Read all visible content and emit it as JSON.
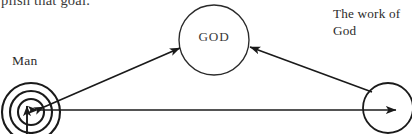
{
  "page": {
    "width": 412,
    "height": 134,
    "background_color": "#ffffff",
    "ink_color": "#1a1a1a"
  },
  "cut_text": {
    "text": "plish that goal.",
    "note": "partially cropped line of body text at very top of image"
  },
  "labels": {
    "man": "Man",
    "god": "GOD",
    "work_of_god": "The work of\nGod"
  },
  "diagram": {
    "type": "node-arrow-diagram",
    "nodes": [
      {
        "id": "man",
        "label": "Man",
        "shape": "concentric-circles",
        "rings": 3,
        "cx": 31,
        "cy": 112,
        "radii": [
          29,
          21,
          13
        ],
        "stroke": "#1a1a1a"
      },
      {
        "id": "god",
        "label": "GOD",
        "shape": "circle",
        "cx": 214,
        "cy": 40,
        "r": 35,
        "stroke": "#1a1a1a"
      },
      {
        "id": "work",
        "label": "The work of God",
        "shape": "circle",
        "cx": 388,
        "cy": 108,
        "r": 25,
        "stroke": "#1a1a1a"
      }
    ],
    "arrows": [
      {
        "id": "man-god",
        "from": "man",
        "to": "god",
        "heads": "both",
        "description": "double-headed diagonal arrow between Man circles and GOD circle"
      },
      {
        "id": "work-god",
        "from": "work",
        "to": "god",
        "heads": "end",
        "description": "diagonal arrow from the work-of-God circle up-left to GOD circle"
      },
      {
        "id": "man-work",
        "from": "man",
        "to": "work",
        "heads": "both",
        "description": "horizontal double-headed arrow between Man circles and work-of-God circle"
      },
      {
        "id": "below-man",
        "from": "below",
        "to": "man",
        "heads": "end",
        "description": "vertical arrow rising from below the image into the centre of the Man circles"
      }
    ]
  }
}
